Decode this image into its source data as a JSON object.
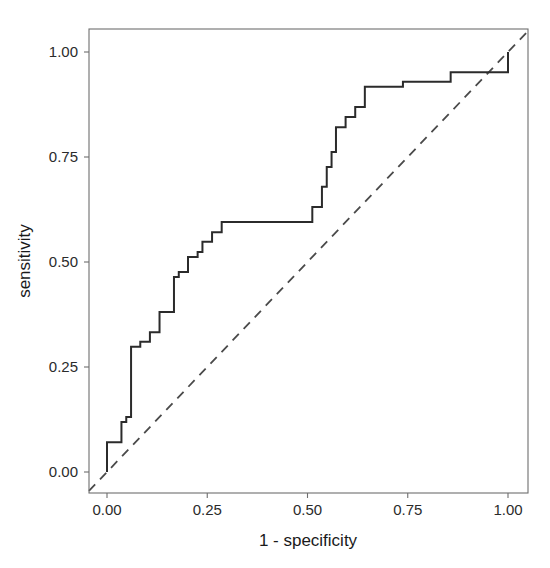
{
  "figure": {
    "background_color": "#ffffff",
    "type": "roc-curve-plot"
  },
  "axes": {
    "x_title": "1 - specificity",
    "y_title": "sensitivity",
    "x_ticks": [
      "0.00",
      "0.25",
      "0.50",
      "0.75",
      "1.00"
    ],
    "y_ticks": [
      "0.00",
      "0.25",
      "0.50",
      "0.75",
      "1.00"
    ],
    "x_tick_values": [
      0.0,
      0.25,
      0.5,
      0.75,
      1.0
    ],
    "y_tick_values": [
      0.0,
      0.25,
      0.5,
      0.75,
      1.0
    ],
    "tick_color": "#6e6e6e",
    "label_color": "#2b2b2b"
  },
  "chart_data": {
    "type": "line",
    "title": "",
    "subtitle": "",
    "xlabel": "1 - specificity",
    "ylabel": "sensitivity",
    "xlim": [
      -0.045,
      1.05
    ],
    "ylim": [
      -0.045,
      1.05
    ],
    "grid": false,
    "legend": null,
    "series": [
      {
        "name": "ROC curve",
        "style": "step-solid",
        "color": "#2b2b2b",
        "x": [
          0.0,
          0.0,
          0.012,
          0.012,
          0.036,
          0.036,
          0.048,
          0.048,
          0.06,
          0.06,
          0.083,
          0.083,
          0.107,
          0.107,
          0.131,
          0.131,
          0.167,
          0.167,
          0.179,
          0.179,
          0.202,
          0.202,
          0.226,
          0.226,
          0.238,
          0.238,
          0.262,
          0.262,
          0.286,
          0.286,
          0.417,
          0.417,
          0.512,
          0.512,
          0.524,
          0.524,
          0.536,
          0.536,
          0.548,
          0.548,
          0.56,
          0.56,
          0.571,
          0.571,
          0.595,
          0.595,
          0.619,
          0.619,
          0.643,
          0.643,
          0.738,
          0.738,
          0.857,
          0.857,
          1.0,
          1.0
        ],
        "y": [
          0.0,
          0.071,
          0.071,
          0.071,
          0.071,
          0.119,
          0.119,
          0.131,
          0.131,
          0.298,
          0.298,
          0.31,
          0.31,
          0.333,
          0.333,
          0.381,
          0.381,
          0.464,
          0.464,
          0.476,
          0.476,
          0.512,
          0.512,
          0.524,
          0.524,
          0.548,
          0.548,
          0.571,
          0.571,
          0.595,
          0.595,
          0.595,
          0.595,
          0.631,
          0.631,
          0.631,
          0.631,
          0.679,
          0.679,
          0.726,
          0.726,
          0.762,
          0.762,
          0.821,
          0.821,
          0.845,
          0.845,
          0.869,
          0.869,
          0.917,
          0.917,
          0.929,
          0.929,
          0.952,
          0.952,
          1.0
        ]
      },
      {
        "name": "reference diagonal",
        "style": "dashed",
        "color": "#4a4a4a",
        "x": [
          -0.045,
          1.05
        ],
        "y": [
          -0.045,
          1.05
        ]
      }
    ]
  },
  "layout": {
    "panel_left_px": 89,
    "panel_right_px": 528,
    "panel_top_px": 29,
    "panel_bottom_px": 493,
    "x0_px": 107,
    "x1_px": 508,
    "y0_px": 472,
    "y1_px": 52
  }
}
